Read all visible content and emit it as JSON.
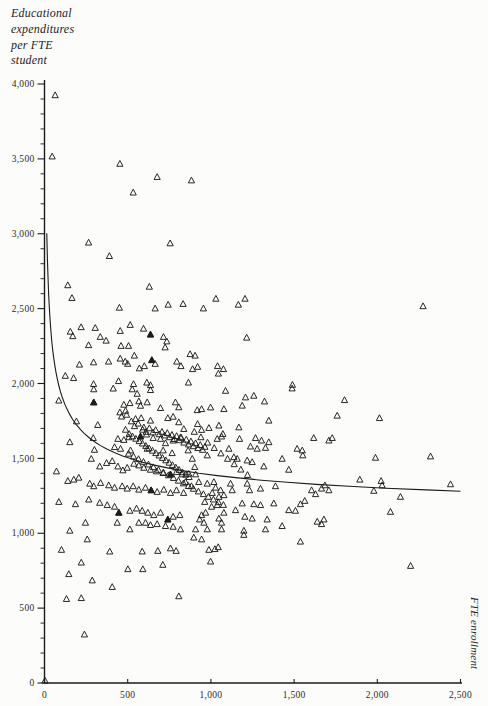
{
  "figure": {
    "y_axis_title_lines": [
      "Educational",
      "expenditures",
      "per FTE",
      "student"
    ],
    "x_axis_title": "FTE enrollment",
    "y_tick_labels": [
      "4,000",
      "3,500",
      "3,000",
      "2,500",
      "2,000",
      "1,500",
      "1,000",
      "500",
      "0"
    ],
    "x_tick_labels": [
      "0",
      "500",
      "1,000",
      "1,500",
      "2,000",
      "2,500"
    ]
  },
  "colors": {
    "ink": "#1c1c1c",
    "label": "#2b2b2b",
    "paper": "#fcfcfa"
  },
  "chart_data": {
    "type": "scatter",
    "marker": "open-triangle",
    "title": "",
    "xlabel": "FTE enrollment",
    "ylabel": "Educational expenditures per FTE student",
    "xlim": [
      0,
      2500
    ],
    "ylim": [
      0,
      4000
    ],
    "x_tick_interval": 500,
    "y_tick_interval": 500,
    "y_minor_tick_interval": 100,
    "grid": false,
    "legend": "none",
    "fit_curve": {
      "type": "power-decay",
      "formula": "y = 1033 + 5662 / x^0.4",
      "a": 1033,
      "b": 5662,
      "exp": -0.4,
      "x_range": [
        14,
        2500
      ]
    },
    "points": [
      [
        64,
        3924
      ],
      [
        46,
        3515
      ],
      [
        453,
        3466
      ],
      [
        677,
        3378
      ],
      [
        533,
        3274
      ],
      [
        883,
        3355
      ],
      [
        265,
        2940
      ],
      [
        755,
        2935
      ],
      [
        390,
        2850
      ],
      [
        140,
        2655
      ],
      [
        630,
        2645
      ],
      [
        165,
        2570
      ],
      [
        450,
        2505
      ],
      [
        665,
        2500
      ],
      [
        743,
        2525
      ],
      [
        833,
        2530
      ],
      [
        220,
        2375
      ],
      [
        305,
        2370
      ],
      [
        155,
        2345
      ],
      [
        170,
        2315
      ],
      [
        515,
        2390
      ],
      [
        455,
        2350
      ],
      [
        595,
        2365
      ],
      [
        637,
        2326
      ],
      [
        335,
        2310
      ],
      [
        370,
        2285
      ],
      [
        265,
        2255
      ],
      [
        460,
        2250
      ],
      [
        505,
        2250
      ],
      [
        715,
        2310
      ],
      [
        735,
        2280
      ],
      [
        725,
        2240
      ],
      [
        210,
        2125
      ],
      [
        295,
        2140
      ],
      [
        385,
        2145
      ],
      [
        455,
        2165
      ],
      [
        485,
        2145
      ],
      [
        500,
        2130
      ],
      [
        540,
        2185
      ],
      [
        570,
        2100
      ],
      [
        600,
        2115
      ],
      [
        645,
        2155
      ],
      [
        665,
        2130
      ],
      [
        795,
        2145
      ],
      [
        820,
        2115
      ],
      [
        125,
        2050
      ],
      [
        175,
        2035
      ],
      [
        295,
        1995
      ],
      [
        445,
        2015
      ],
      [
        535,
        1995
      ],
      [
        615,
        2005
      ],
      [
        637,
        1988
      ],
      [
        1030,
        2565
      ],
      [
        955,
        2500
      ],
      [
        1165,
        2525
      ],
      [
        1205,
        2565
      ],
      [
        1215,
        2305
      ],
      [
        875,
        2195
      ],
      [
        905,
        2185
      ],
      [
        920,
        2110
      ],
      [
        890,
        2095
      ],
      [
        1040,
        2115
      ],
      [
        1075,
        2095
      ],
      [
        1045,
        2065
      ],
      [
        865,
        2005
      ],
      [
        1490,
        1990
      ],
      [
        2275,
        2515
      ],
      [
        296,
        1960
      ],
      [
        413,
        1965
      ],
      [
        527,
        1960
      ],
      [
        557,
        1930
      ],
      [
        637,
        1955
      ],
      [
        86,
        1885
      ],
      [
        296,
        1873
      ],
      [
        477,
        1857
      ],
      [
        513,
        1868
      ],
      [
        567,
        1880
      ],
      [
        577,
        1850
      ],
      [
        617,
        1873
      ],
      [
        697,
        1835
      ],
      [
        787,
        1873
      ],
      [
        807,
        1840
      ],
      [
        192,
        1746
      ],
      [
        320,
        1722
      ],
      [
        453,
        1806
      ],
      [
        487,
        1817
      ],
      [
        547,
        1762
      ],
      [
        581,
        1768
      ],
      [
        597,
        1706
      ],
      [
        637,
        1751
      ],
      [
        741,
        1768
      ],
      [
        773,
        1777
      ],
      [
        807,
        1740
      ],
      [
        837,
        1695
      ],
      [
        152,
        1607
      ],
      [
        293,
        1635
      ],
      [
        300,
        1556
      ],
      [
        441,
        1629
      ],
      [
        477,
        1622
      ],
      [
        507,
        1640
      ],
      [
        577,
        1645
      ],
      [
        613,
        1658
      ],
      [
        653,
        1635
      ],
      [
        697,
        1629
      ],
      [
        727,
        1600
      ],
      [
        773,
        1618
      ],
      [
        817,
        1640
      ],
      [
        421,
        1574
      ],
      [
        457,
        1563
      ],
      [
        517,
        1552
      ],
      [
        617,
        1563
      ],
      [
        713,
        1552
      ],
      [
        767,
        1534
      ],
      [
        281,
        1496
      ],
      [
        332,
        1445
      ],
      [
        373,
        1468
      ],
      [
        407,
        1481
      ],
      [
        441,
        1445
      ],
      [
        471,
        1419
      ],
      [
        497,
        1436
      ],
      [
        537,
        1463
      ],
      [
        567,
        1452
      ],
      [
        597,
        1436
      ],
      [
        637,
        1423
      ],
      [
        673,
        1412
      ],
      [
        713,
        1401
      ],
      [
        757,
        1392
      ],
      [
        793,
        1408
      ],
      [
        827,
        1392
      ],
      [
        72,
        1412
      ],
      [
        140,
        1348
      ],
      [
        176,
        1357
      ],
      [
        206,
        1370
      ],
      [
        272,
        1330
      ],
      [
        296,
        1313
      ],
      [
        337,
        1335
      ],
      [
        386,
        1319
      ],
      [
        421,
        1303
      ],
      [
        467,
        1313
      ],
      [
        497,
        1297
      ],
      [
        533,
        1313
      ],
      [
        567,
        1290
      ],
      [
        607,
        1303
      ],
      [
        641,
        1286
      ],
      [
        677,
        1275
      ],
      [
        717,
        1290
      ],
      [
        757,
        1268
      ],
      [
        793,
        1286
      ],
      [
        836,
        1268
      ],
      [
        86,
        1208
      ],
      [
        186,
        1193
      ],
      [
        266,
        1224
      ],
      [
        332,
        1202
      ],
      [
        377,
        1187
      ],
      [
        421,
        1176
      ],
      [
        447,
        1136
      ],
      [
        513,
        1149
      ],
      [
        553,
        1164
      ],
      [
        587,
        1149
      ],
      [
        621,
        1136
      ],
      [
        657,
        1120
      ],
      [
        697,
        1136
      ],
      [
        741,
        1091
      ],
      [
        773,
        1109
      ],
      [
        813,
        1120
      ],
      [
        246,
        1069
      ],
      [
        437,
        1069
      ],
      [
        513,
        1025
      ],
      [
        567,
        1069
      ],
      [
        607,
        1069
      ],
      [
        637,
        1054
      ],
      [
        677,
        1060
      ],
      [
        727,
        1047
      ],
      [
        773,
        1042
      ],
      [
        817,
        1025
      ],
      [
        152,
        1016
      ],
      [
        1088,
        1950
      ],
      [
        1208,
        1906
      ],
      [
        1258,
        1917
      ],
      [
        1322,
        1879
      ],
      [
        1488,
        1966
      ],
      [
        918,
        1821
      ],
      [
        944,
        1828
      ],
      [
        998,
        1839
      ],
      [
        1078,
        1828
      ],
      [
        1188,
        1851
      ],
      [
        1348,
        1751
      ],
      [
        988,
        1702
      ],
      [
        1048,
        1718
      ],
      [
        1072,
        1662
      ],
      [
        944,
        1689
      ],
      [
        1038,
        1629
      ],
      [
        1064,
        1645
      ],
      [
        1168,
        1706
      ],
      [
        1172,
        1629
      ],
      [
        1268,
        1635
      ],
      [
        1304,
        1618
      ],
      [
        1238,
        1578
      ],
      [
        1278,
        1563
      ],
      [
        1328,
        1569
      ],
      [
        1348,
        1607
      ],
      [
        1108,
        1563
      ],
      [
        1138,
        1507
      ],
      [
        1158,
        1496
      ],
      [
        1218,
        1485
      ],
      [
        1248,
        1474
      ],
      [
        1318,
        1445
      ],
      [
        1428,
        1496
      ],
      [
        1468,
        1423
      ],
      [
        1518,
        1563
      ],
      [
        1549,
        1552
      ],
      [
        1552,
        1519
      ],
      [
        1618,
        1635
      ],
      [
        1709,
        1618
      ],
      [
        978,
        1519
      ],
      [
        863,
        1552
      ],
      [
        888,
        1496
      ],
      [
        903,
        1441
      ],
      [
        867,
        1396
      ],
      [
        908,
        1392
      ],
      [
        847,
        1341
      ],
      [
        883,
        1313
      ],
      [
        927,
        1341
      ],
      [
        978,
        1330
      ],
      [
        1018,
        1341
      ],
      [
        1028,
        1303
      ],
      [
        1058,
        1286
      ],
      [
        1008,
        1268
      ],
      [
        1048,
        1242
      ],
      [
        1078,
        1253
      ],
      [
        1118,
        1330
      ],
      [
        1128,
        1286
      ],
      [
        1218,
        1330
      ],
      [
        1232,
        1286
      ],
      [
        1298,
        1297
      ],
      [
        1388,
        1313
      ],
      [
        1468,
        1153
      ],
      [
        1538,
        1193
      ],
      [
        1564,
        1215
      ],
      [
        1605,
        1286
      ],
      [
        1629,
        1260
      ],
      [
        1665,
        1297
      ],
      [
        1685,
        1319
      ],
      [
        1709,
        1286
      ],
      [
        963,
        1208
      ],
      [
        1004,
        1176
      ],
      [
        1038,
        1187
      ],
      [
        1078,
        1136
      ],
      [
        1148,
        1153
      ],
      [
        1188,
        1198
      ],
      [
        1258,
        1193
      ],
      [
        1298,
        1187
      ],
      [
        1378,
        1198
      ],
      [
        944,
        1120
      ],
      [
        968,
        1136
      ],
      [
        932,
        1091
      ],
      [
        958,
        1069
      ],
      [
        1048,
        1097
      ],
      [
        1064,
        1069
      ],
      [
        1204,
        1109
      ],
      [
        1248,
        1097
      ],
      [
        1338,
        1091
      ],
      [
        1428,
        1047
      ],
      [
        1508,
        1149
      ],
      [
        1639,
        1076
      ],
      [
        1665,
        1060
      ],
      [
        1679,
        1091
      ],
      [
        908,
        1025
      ],
      [
        978,
        1025
      ],
      [
        1064,
        1025
      ],
      [
        1198,
        1016
      ],
      [
        1328,
        1025
      ],
      [
        1198,
        988
      ],
      [
        1803,
        1888
      ],
      [
        1759,
        1784
      ],
      [
        2013,
        1768
      ],
      [
        1729,
        1635
      ],
      [
        1989,
        1503
      ],
      [
        2320,
        1512
      ],
      [
        1895,
        1357
      ],
      [
        2023,
        1348
      ],
      [
        2029,
        1319
      ],
      [
        1979,
        1282
      ],
      [
        2139,
        1242
      ],
      [
        2440,
        1326
      ],
      [
        2079,
        1142
      ],
      [
        257,
        958
      ],
      [
        102,
        888
      ],
      [
        221,
        803
      ],
      [
        392,
        877
      ],
      [
        146,
        726
      ],
      [
        287,
        684
      ],
      [
        407,
        640
      ],
      [
        501,
        759
      ],
      [
        587,
        877
      ],
      [
        591,
        759
      ],
      [
        681,
        881
      ],
      [
        711,
        788
      ],
      [
        757,
        898
      ],
      [
        791,
        881
      ],
      [
        132,
        560
      ],
      [
        221,
        566
      ],
      [
        807,
        578
      ],
      [
        240,
        323
      ],
      [
        897,
        970
      ],
      [
        944,
        958
      ],
      [
        988,
        888
      ],
      [
        1024,
        893
      ],
      [
        1044,
        906
      ],
      [
        998,
        810
      ],
      [
        1538,
        943
      ],
      [
        2200,
        781
      ],
      [
        3,
        15
      ],
      [
        463,
        1778
      ],
      [
        493,
        1790
      ],
      [
        522,
        1746
      ],
      [
        541,
        1714
      ],
      [
        563,
        1731
      ],
      [
        590,
        1690
      ],
      [
        611,
        1676
      ],
      [
        630,
        1700
      ],
      [
        652,
        1672
      ],
      [
        668,
        1688
      ],
      [
        690,
        1660
      ],
      [
        706,
        1676
      ],
      [
        722,
        1652
      ],
      [
        738,
        1668
      ],
      [
        752,
        1640
      ],
      [
        766,
        1656
      ],
      [
        780,
        1628
      ],
      [
        794,
        1648
      ],
      [
        808,
        1620
      ],
      [
        822,
        1636
      ],
      [
        838,
        1604
      ],
      [
        852,
        1624
      ],
      [
        866,
        1592
      ],
      [
        880,
        1612
      ],
      [
        894,
        1580
      ],
      [
        908,
        1600
      ],
      [
        922,
        1568
      ],
      [
        936,
        1588
      ],
      [
        950,
        1556
      ],
      [
        964,
        1576
      ],
      [
        487,
        1690
      ],
      [
        509,
        1662
      ],
      [
        529,
        1646
      ],
      [
        549,
        1630
      ],
      [
        569,
        1614
      ],
      [
        589,
        1598
      ],
      [
        609,
        1582
      ],
      [
        629,
        1566
      ],
      [
        649,
        1550
      ],
      [
        669,
        1534
      ],
      [
        689,
        1518
      ],
      [
        709,
        1502
      ],
      [
        729,
        1486
      ],
      [
        749,
        1470
      ],
      [
        769,
        1454
      ],
      [
        789,
        1438
      ],
      [
        809,
        1422
      ],
      [
        829,
        1406
      ],
      [
        849,
        1390
      ],
      [
        869,
        1374
      ],
      [
        505,
        1530
      ],
      [
        535,
        1512
      ],
      [
        565,
        1494
      ],
      [
        595,
        1476
      ],
      [
        625,
        1458
      ],
      [
        655,
        1440
      ],
      [
        685,
        1422
      ],
      [
        715,
        1404
      ],
      [
        745,
        1386
      ],
      [
        775,
        1368
      ],
      [
        805,
        1350
      ],
      [
        835,
        1332
      ],
      [
        865,
        1314
      ],
      [
        895,
        1296
      ],
      [
        925,
        1278
      ],
      [
        955,
        1260
      ],
      [
        985,
        1242
      ],
      [
        1015,
        1224
      ],
      [
        1045,
        1206
      ],
      [
        1075,
        1188
      ],
      [
        900,
        1676
      ],
      [
        940,
        1640
      ],
      [
        980,
        1604
      ],
      [
        1020,
        1568
      ],
      [
        1060,
        1532
      ],
      [
        1100,
        1496
      ],
      [
        1140,
        1460
      ],
      [
        1180,
        1424
      ],
      [
        1220,
        1388
      ],
      [
        920,
        1728
      ]
    ],
    "bold_points": [
      [
        296,
        1873
      ],
      [
        637,
        2326
      ],
      [
        645,
        2155
      ],
      [
        577,
        1645
      ],
      [
        757,
        1392
      ],
      [
        641,
        1286
      ],
      [
        447,
        1136
      ],
      [
        741,
        1091
      ]
    ]
  }
}
